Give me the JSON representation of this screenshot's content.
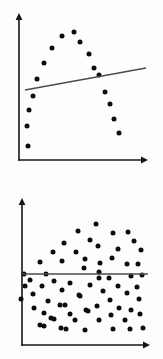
{
  "figure": {
    "title": "",
    "background_color": "#fdfdfc",
    "width": 163,
    "height": 359,
    "panel_count": 2,
    "point_color": "#0d0d0d",
    "axis_color": "#161616",
    "line_color": "#4a4a4a"
  },
  "chart_data": [
    {
      "type": "scatter",
      "id": "top-panel",
      "title": "",
      "subtitle": "",
      "xlabel": "",
      "ylabel": "",
      "xlim": [
        0,
        100
      ],
      "ylim": [
        0,
        100
      ],
      "grid": false,
      "legend": null,
      "annotations": [],
      "description": "Strong inverted-U (quadratic) relationship with a near-flat fitted regression line",
      "axes": {
        "x_axis": {
          "x1": 19,
          "y1": 160,
          "x2": 148,
          "y2": 160,
          "arrow": "right"
        },
        "y_axis": {
          "x1": 19,
          "y1": 160,
          "x2": 19,
          "y2": 13,
          "arrow": "up"
        }
      },
      "points_px": [
        [
          28,
          146
        ],
        [
          27,
          126
        ],
        [
          29,
          110
        ],
        [
          33,
          96
        ],
        [
          37,
          79
        ],
        [
          44,
          63
        ],
        [
          52,
          48
        ],
        [
          62,
          36
        ],
        [
          74,
          32
        ],
        [
          80,
          42
        ],
        [
          89,
          54
        ],
        [
          94,
          68
        ],
        [
          99,
          75
        ],
        [
          105,
          92
        ],
        [
          110,
          104
        ],
        [
          114,
          119
        ],
        [
          119,
          133
        ]
      ],
      "fit_line_px": {
        "x1": 25,
        "y1": 90,
        "x2": 146,
        "y2": 68
      },
      "fit_line": {
        "slope": "slightly positive",
        "r_squared_visual": "near zero"
      },
      "n_points": 17
    },
    {
      "type": "scatter",
      "id": "bottom-panel",
      "title": "",
      "subtitle": "",
      "xlabel": "",
      "ylabel": "",
      "xlim": [
        0,
        100
      ],
      "ylim": [
        0,
        100
      ],
      "grid": false,
      "legend": null,
      "annotations": [],
      "description": "Random cloud with no relationship; flat fitted regression line",
      "axes": {
        "x_axis": {
          "x1": 22,
          "y1": 345,
          "x2": 150,
          "y2": 345,
          "arrow": "right"
        },
        "y_axis": {
          "x1": 22,
          "y1": 345,
          "x2": 22,
          "y2": 198,
          "arrow": "up"
        }
      },
      "points_px": [
        [
          96,
          224
        ],
        [
          78,
          231
        ],
        [
          113,
          233
        ],
        [
          128,
          232
        ],
        [
          90,
          240
        ],
        [
          134,
          241
        ],
        [
          64,
          243
        ],
        [
          98,
          246
        ],
        [
          118,
          249
        ],
        [
          53,
          252
        ],
        [
          76,
          252
        ],
        [
          141,
          250
        ],
        [
          112,
          258
        ],
        [
          85,
          259
        ],
        [
          40,
          262
        ],
        [
          62,
          261
        ],
        [
          100,
          263
        ],
        [
          127,
          264
        ],
        [
          138,
          264
        ],
        [
          84,
          268
        ],
        [
          99,
          272
        ],
        [
          24,
          274
        ],
        [
          46,
          274
        ],
        [
          99,
          278
        ],
        [
          109,
          278
        ],
        [
          131,
          276
        ],
        [
          142,
          275
        ],
        [
          30,
          280
        ],
        [
          54,
          281
        ],
        [
          70,
          283
        ],
        [
          25,
          286
        ],
        [
          42,
          286
        ],
        [
          90,
          285
        ],
        [
          118,
          286
        ],
        [
          137,
          287
        ],
        [
          62,
          290
        ],
        [
          103,
          291
        ],
        [
          33,
          294
        ],
        [
          79,
          295
        ],
        [
          80,
          296
        ],
        [
          127,
          293
        ],
        [
          21,
          299
        ],
        [
          48,
          301
        ],
        [
          110,
          300
        ],
        [
          139,
          299
        ],
        [
          60,
          305
        ],
        [
          65,
          305
        ],
        [
          97,
          306
        ],
        [
          34,
          308
        ],
        [
          119,
          308
        ],
        [
          86,
          310
        ],
        [
          88,
          311
        ],
        [
          131,
          310
        ],
        [
          44,
          313
        ],
        [
          70,
          314
        ],
        [
          111,
          315
        ],
        [
          140,
          314
        ],
        [
          51,
          318
        ],
        [
          54,
          319
        ],
        [
          75,
          320
        ],
        [
          99,
          320
        ],
        [
          125,
          320
        ],
        [
          40,
          325
        ],
        [
          44,
          326
        ],
        [
          61,
          328
        ],
        [
          66,
          329
        ],
        [
          85,
          330
        ],
        [
          113,
          329
        ],
        [
          130,
          329
        ],
        [
          143,
          328
        ]
      ],
      "fit_line_px": {
        "x1": 22,
        "y1": 274,
        "x2": 148,
        "y2": 274
      },
      "fit_line": {
        "slope": "zero",
        "r_squared_visual": "zero"
      },
      "n_points": 70
    }
  ]
}
